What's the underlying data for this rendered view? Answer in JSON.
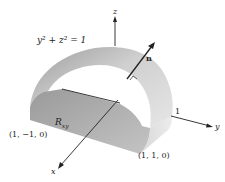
{
  "figure": {
    "equation": "y² + z² = 1",
    "axes": {
      "x_label": "x",
      "y_label": "y",
      "z_label": "z",
      "y_tick": "1"
    },
    "normal_label": "n",
    "region_label": "R",
    "region_subscript": "xy",
    "points": {
      "left_corner": "(1, −1, 0)",
      "right_corner": "(1, 1, 0)"
    },
    "colors": {
      "surface_light": "#e2e2e2",
      "surface_dark": "#a9a9a9",
      "axis": "#222222"
    }
  }
}
